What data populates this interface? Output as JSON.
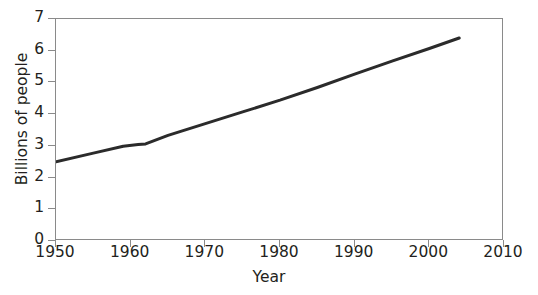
{
  "chart_data": {
    "type": "line",
    "title": "",
    "xlabel": "Year",
    "ylabel": "Billions of people",
    "xlim": [
      1950,
      2010
    ],
    "ylim": [
      0,
      7
    ],
    "xticks": [
      1950,
      1960,
      1970,
      1980,
      1990,
      2000,
      2010
    ],
    "xticklabels": [
      "1950",
      "1960",
      "1970",
      "1980",
      "1990",
      "2000",
      "2010"
    ],
    "yticks": [
      0,
      1,
      2,
      3,
      4,
      5,
      6,
      7
    ],
    "yticklabels": [
      "0",
      "1",
      "2",
      "3",
      "4",
      "5",
      "6",
      "7"
    ],
    "grid": false,
    "legend": null,
    "series": [
      {
        "name": "World population",
        "color": "#2b2b2b",
        "linewidth": 3,
        "x": [
          1950,
          1955,
          1959,
          1961,
          1962,
          1965,
          1970,
          1975,
          1980,
          1985,
          1990,
          1995,
          2000,
          2004
        ],
        "y": [
          2.5,
          2.77,
          2.99,
          3.04,
          3.06,
          3.33,
          3.7,
          4.07,
          4.44,
          4.84,
          5.26,
          5.67,
          6.07,
          6.4
        ]
      }
    ]
  },
  "axes": {
    "frame_color": "#8a8a8a",
    "text_color": "#231f20"
  }
}
